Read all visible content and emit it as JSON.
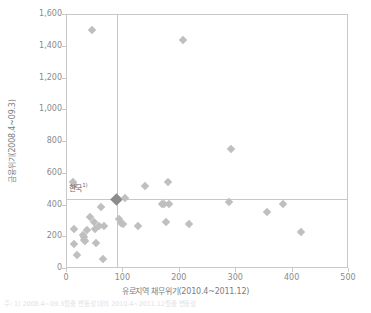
{
  "chart_data": {
    "type": "scatter",
    "title": "",
    "xlabel": "유로지역 채무위기(2010.4~2011.12)",
    "ylabel": "금융위기(2008.4~09.3)",
    "xlim": [
      0,
      500
    ],
    "ylim": [
      0,
      1600
    ],
    "xticks": [
      "0",
      "100",
      "200",
      "300",
      "400",
      "500"
    ],
    "xtick_values": [
      0,
      100,
      200,
      300,
      400,
      500
    ],
    "yticks": [
      "0",
      "200",
      "400",
      "600",
      "800",
      "1,000",
      "1,200",
      "1,400",
      "1,600"
    ],
    "ytick_values": [
      0,
      200,
      400,
      600,
      800,
      1000,
      1200,
      1400,
      1600
    ],
    "grid": false,
    "legend": null,
    "reference_lines": {
      "horizontal_y": 440,
      "vertical_x": 88,
      "color": "#c8c8c8"
    },
    "marker": {
      "shape": "diamond",
      "color": "#bfbfbf",
      "highlight_color": "#8c8c8c"
    },
    "annotations": [
      {
        "label": "한국",
        "superscript": "1)",
        "x": 88,
        "y": 440,
        "label_offset_x": -48,
        "label_offset_y": -16
      }
    ],
    "points": [
      {
        "x": 11,
        "y": 550
      },
      {
        "x": 12,
        "y": 530
      },
      {
        "x": 12,
        "y": 255
      },
      {
        "x": 13,
        "y": 160
      },
      {
        "x": 18,
        "y": 90
      },
      {
        "x": 28,
        "y": 215
      },
      {
        "x": 30,
        "y": 200
      },
      {
        "x": 31,
        "y": 185
      },
      {
        "x": 32,
        "y": 175
      },
      {
        "x": 36,
        "y": 245
      },
      {
        "x": 40,
        "y": 330
      },
      {
        "x": 45,
        "y": 1505
      },
      {
        "x": 48,
        "y": 295
      },
      {
        "x": 50,
        "y": 250
      },
      {
        "x": 52,
        "y": 165
      },
      {
        "x": 57,
        "y": 270
      },
      {
        "x": 60,
        "y": 390
      },
      {
        "x": 63,
        "y": 60
      },
      {
        "x": 65,
        "y": 270
      },
      {
        "x": 88,
        "y": 440,
        "highlight": true
      },
      {
        "x": 92,
        "y": 315
      },
      {
        "x": 96,
        "y": 290
      },
      {
        "x": 99,
        "y": 285
      },
      {
        "x": 103,
        "y": 450
      },
      {
        "x": 125,
        "y": 270
      },
      {
        "x": 139,
        "y": 520
      },
      {
        "x": 168,
        "y": 412
      },
      {
        "x": 172,
        "y": 412
      },
      {
        "x": 175,
        "y": 295
      },
      {
        "x": 179,
        "y": 550
      },
      {
        "x": 181,
        "y": 408
      },
      {
        "x": 205,
        "y": 1445
      },
      {
        "x": 216,
        "y": 285
      },
      {
        "x": 288,
        "y": 420
      },
      {
        "x": 290,
        "y": 755
      },
      {
        "x": 355,
        "y": 358
      },
      {
        "x": 383,
        "y": 410
      },
      {
        "x": 415,
        "y": 235
      }
    ]
  },
  "footnote": "주: 1) 2008.4~09.3월중 변동성 대비 2010.4~2011.12월중 변동성"
}
